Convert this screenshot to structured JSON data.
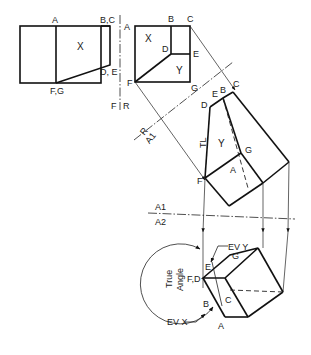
{
  "figure": {
    "colors": {
      "line": "#111111",
      "background": "#ffffff"
    }
  },
  "views": {
    "front": {
      "labels": {
        "A": "A",
        "BC": "B,C",
        "DE": "D, E",
        "FG": "F,G",
        "plane": "X"
      }
    },
    "right_side": {
      "labels": {
        "A": "A",
        "B": "B",
        "C": "C",
        "D": "D",
        "E": "E",
        "F": "F",
        "G": "G",
        "plane_x": "X",
        "plane_y": "Y"
      }
    },
    "auxiliary_1": {
      "labels": {
        "B": "B",
        "C": "C",
        "D": "D",
        "E": "E",
        "F": "F",
        "G": "G",
        "A": "A",
        "plane_y": "Y",
        "true_length": "TL"
      }
    },
    "auxiliary_2": {
      "labels": {
        "G": "G",
        "E": "E",
        "FD": "F,D",
        "B": "B",
        "C": "C",
        "A": "A"
      },
      "annotations": {
        "edge_view_y": "EV Y",
        "edge_view_x": "EV X",
        "true_angle_line1": "True",
        "true_angle_line2": "Angle"
      }
    }
  },
  "fold_lines": {
    "f_r": {
      "top": "F",
      "bottom": "R",
      "side_left": "A"
    },
    "r_a1": {
      "top": "R",
      "bottom": "A1"
    },
    "a1_a2": {
      "top": "A1",
      "bottom": "A2"
    }
  }
}
